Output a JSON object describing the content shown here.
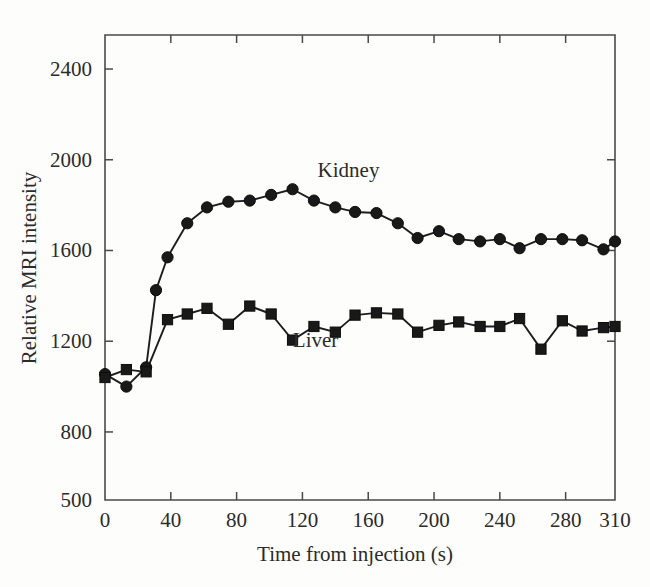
{
  "figure": {
    "background_color": "#fdfdfc",
    "ink_color": "#1d1d1d"
  },
  "chart_data": {
    "type": "line",
    "title": "",
    "xlabel": "Time from injection (s)",
    "ylabel": "Relative MRI intensity",
    "xlim": [
      0,
      310
    ],
    "ylim": [
      500,
      2550
    ],
    "xticks": [
      0,
      40,
      80,
      120,
      160,
      200,
      240,
      280,
      310
    ],
    "xtick_labels": [
      "0",
      "40",
      "80",
      "120",
      "160",
      "200",
      "240",
      "280",
      "310"
    ],
    "yticks": [
      500,
      800,
      1200,
      1600,
      2000,
      2400
    ],
    "ytick_labels": [
      "500",
      "800",
      "1200",
      "1600",
      "2000",
      "2400"
    ],
    "grid": false,
    "legend_position": "inline-annotation",
    "series": [
      {
        "name": "Kidney",
        "marker": "circle",
        "color": "#1d1d1d",
        "label_x": 148,
        "label_y": 1925,
        "x": [
          0,
          13,
          25,
          31,
          38,
          50,
          62,
          75,
          88,
          101,
          114,
          127,
          140,
          152,
          165,
          178,
          190,
          203,
          215,
          228,
          240,
          252,
          265,
          278,
          290,
          303,
          310
        ],
        "y": [
          1055,
          1000,
          1085,
          1425,
          1570,
          1720,
          1790,
          1815,
          1820,
          1845,
          1870,
          1820,
          1790,
          1770,
          1765,
          1720,
          1655,
          1685,
          1650,
          1640,
          1650,
          1610,
          1650,
          1650,
          1645,
          1605,
          1640
        ]
      },
      {
        "name": "Liver",
        "marker": "square",
        "color": "#1d1d1d",
        "label_x": 128,
        "label_y": 1175,
        "x": [
          0,
          13,
          25,
          38,
          50,
          62,
          75,
          88,
          101,
          114,
          127,
          140,
          152,
          165,
          178,
          190,
          203,
          215,
          228,
          240,
          252,
          265,
          278,
          290,
          303,
          310
        ],
        "y": [
          1040,
          1075,
          1065,
          1295,
          1320,
          1345,
          1275,
          1355,
          1320,
          1205,
          1265,
          1240,
          1315,
          1325,
          1320,
          1240,
          1270,
          1285,
          1265,
          1265,
          1300,
          1165,
          1290,
          1245,
          1260,
          1265
        ]
      }
    ]
  },
  "annotations": {
    "kidney_label": "Kidney",
    "liver_label": "Liver"
  }
}
